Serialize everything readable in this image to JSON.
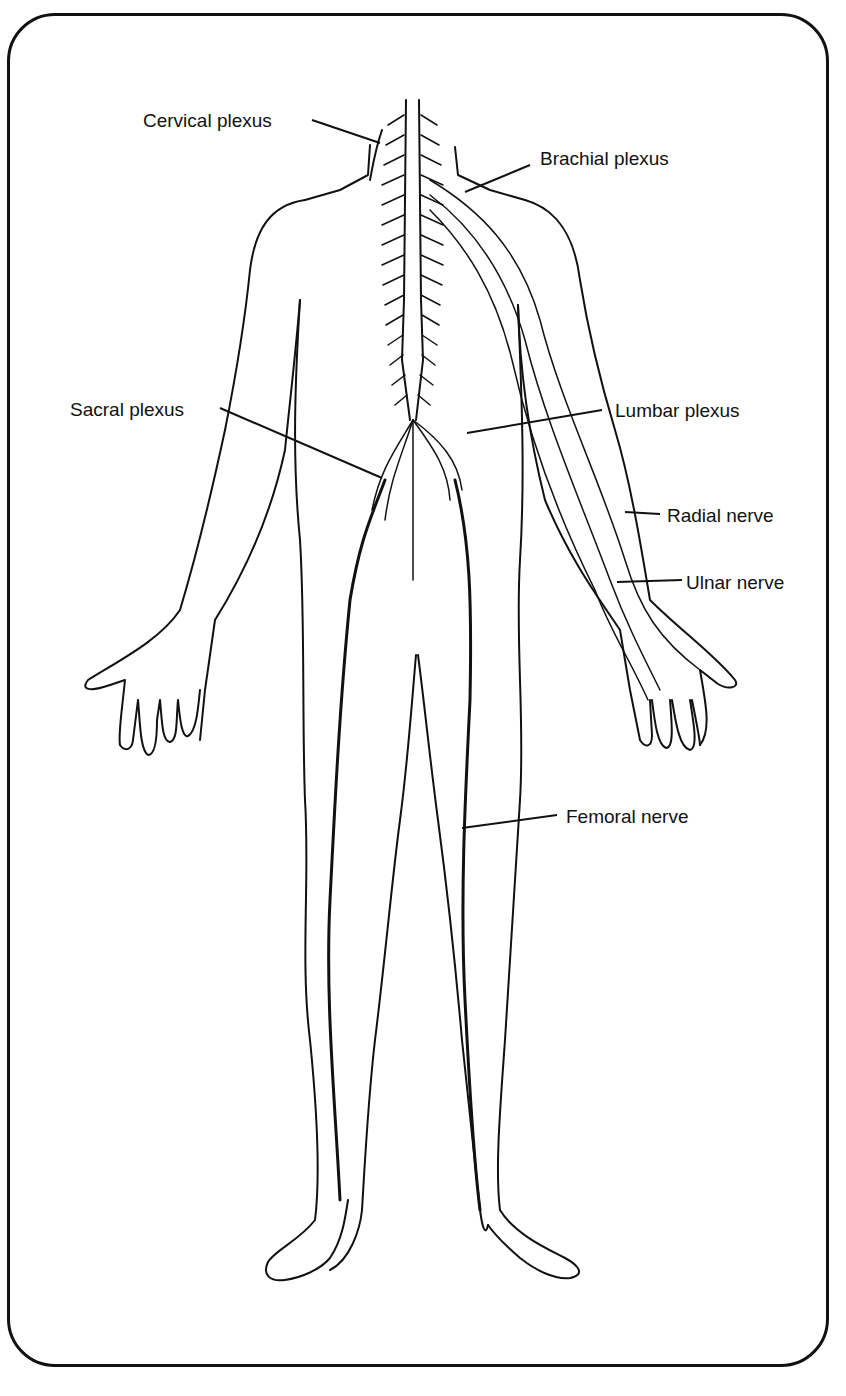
{
  "figure": {
    "line_color": "#111111",
    "background": "#ffffff"
  },
  "labels": {
    "cervical_plexus": "Cervical plexus",
    "brachial_plexus": "Brachial plexus",
    "sacral_plexus": "Sacral plexus",
    "lumbar_plexus": "Lumbar plexus",
    "radial_nerve": "Radial nerve",
    "ulnar_nerve": "Ulnar nerve",
    "femoral_nerve": "Femoral nerve"
  }
}
